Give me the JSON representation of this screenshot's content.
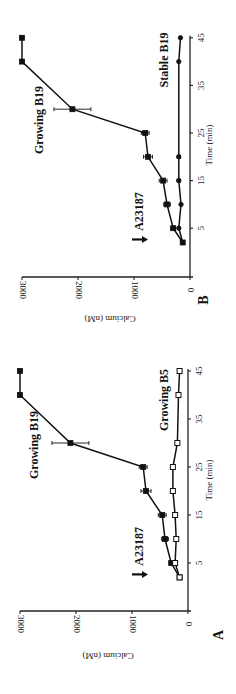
{
  "figure": {
    "orientation": "rotated 90 degrees counter-clockwise",
    "panels": [
      "B",
      "A"
    ]
  },
  "chart_data": [
    {
      "panel": "B",
      "type": "line",
      "title": "",
      "xlabel": "Time (min)",
      "ylabel": "Calcium (nM)",
      "xlim": [
        0,
        45
      ],
      "ylim": [
        0,
        3000
      ],
      "x_ticks": [
        5,
        15,
        25,
        35,
        45
      ],
      "y_ticks": [
        0,
        1000,
        2000,
        3000
      ],
      "grid": false,
      "annotation": {
        "text": "A23187",
        "arrow_at_time": 2
      },
      "series": [
        {
          "name": "Growing B19",
          "marker": "filled-square",
          "x": [
            2,
            5,
            10,
            15,
            20,
            25,
            30,
            40,
            45
          ],
          "values": [
            130,
            300,
            410,
            480,
            750,
            800,
            2100,
            3000,
            3000
          ],
          "errors": [
            0,
            40,
            60,
            70,
            80,
            70,
            330,
            0,
            0
          ]
        },
        {
          "name": "Stable B19",
          "marker": "filled-circle",
          "x": [
            2,
            5,
            10,
            15,
            20,
            40,
            45
          ],
          "values": [
            130,
            200,
            160,
            200,
            200,
            200,
            170
          ],
          "errors": [
            0,
            20,
            0,
            30,
            30,
            0,
            0
          ]
        }
      ]
    },
    {
      "panel": "A",
      "type": "line",
      "title": "",
      "xlabel": "Time (min)",
      "ylabel": "Calcium (nM)",
      "xlim": [
        0,
        45
      ],
      "ylim": [
        0,
        3000
      ],
      "x_ticks": [
        5,
        15,
        25,
        35,
        45
      ],
      "y_ticks": [
        0,
        1000,
        2000,
        3000
      ],
      "grid": false,
      "annotation": {
        "text": "A23187",
        "arrow_at_time": 2
      },
      "series": [
        {
          "name": "Growing B19",
          "marker": "filled-square",
          "x": [
            2,
            5,
            10,
            15,
            20,
            25,
            30,
            40,
            45
          ],
          "values": [
            150,
            300,
            410,
            460,
            750,
            800,
            2100,
            3000,
            3000
          ],
          "errors": [
            0,
            0,
            60,
            70,
            90,
            70,
            330,
            0,
            0
          ]
        },
        {
          "name": "Growing B5",
          "marker": "open-square",
          "x": [
            2,
            5,
            10,
            15,
            20,
            25,
            30,
            40,
            45
          ],
          "values": [
            150,
            230,
            210,
            230,
            270,
            270,
            190,
            170,
            150
          ],
          "errors": [
            0,
            0,
            0,
            0,
            0,
            0,
            0,
            0,
            0
          ]
        }
      ]
    }
  ],
  "layout": {
    "panels": [
      {
        "letter": "B",
        "axis_x0": 190,
        "axis_y_line": 277,
        "t0_y": 252,
        "px_per_min": 4.76,
        "px_per_nM": 0.056,
        "top_y": 35,
        "ylabel_pos": [
          110,
          318
        ],
        "letter_pos": [
          205,
          300
        ],
        "xlabel_pos": [
          210,
          145
        ],
        "series_label_pos": [
          [
            40,
            120
          ],
          [
            165,
            60
          ]
        ],
        "annot_pos": [
          148,
          255
        ]
      },
      {
        "letter": "A",
        "axis_x0": 188,
        "axis_y_line": 611,
        "t0_y": 587,
        "px_per_min": 4.8,
        "px_per_nM": 0.056,
        "top_y": 368,
        "ylabel_pos": [
          108,
          655
        ],
        "letter_pos": [
          220,
          635
        ],
        "xlabel_pos": [
          210,
          480
        ],
        "series_label_pos": [
          [
            35,
            445
          ],
          [
            165,
            400
          ]
        ],
        "annot_pos": [
          148,
          590
        ]
      }
    ]
  }
}
